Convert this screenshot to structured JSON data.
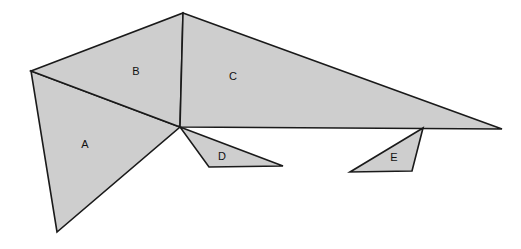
{
  "figure": {
    "background_color": "#ffffff",
    "fill_color": "#cecece",
    "stroke_color": "#1a1a1a",
    "stroke_width": 1.6,
    "label_color": "#111111",
    "width": 521,
    "height": 249,
    "faces": [
      {
        "id": "A",
        "label": "A",
        "label_x": 85,
        "label_y": 145,
        "points": "31,71 180,127 57,232"
      },
      {
        "id": "B",
        "label": "B",
        "label_x": 136,
        "label_y": 72,
        "points": "31,71 183,13 180,127"
      },
      {
        "id": "C",
        "label": "C",
        "label_x": 233,
        "label_y": 77,
        "points": "183,13 502,129 180,127"
      },
      {
        "id": "D",
        "label": "D",
        "label_x": 222,
        "label_y": 157,
        "points": "180,127 283,166 209,167"
      },
      {
        "id": "E",
        "label": "E",
        "label_x": 394,
        "label_y": 158,
        "points": "423,128 412,171 350,172"
      }
    ]
  }
}
